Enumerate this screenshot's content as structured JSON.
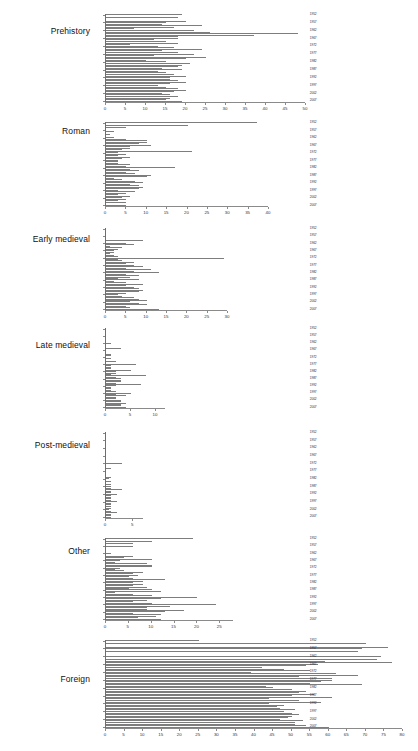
{
  "figure": {
    "type": "multi-panel-horizontal-bar",
    "background": "#ffffff",
    "bar_color": "#7d7d7d",
    "axis_color": "#8a8a8a",
    "panel_count": 7
  },
  "chart_data": [
    {
      "type": "bar",
      "orientation": "horizontal",
      "title": "Prehistory",
      "xlabel": "",
      "ylabel": "",
      "xlim": [
        0,
        50
      ],
      "xticks": [
        0,
        5,
        10,
        15,
        20,
        25,
        30,
        35,
        40,
        45,
        50
      ],
      "xticklabels": [
        "0",
        "5",
        "10",
        "15",
        "20",
        "25",
        "30",
        "35",
        "40",
        "45",
        "50"
      ],
      "grid": false,
      "categories": [
        1952,
        1953,
        1954,
        1955,
        1956,
        1957,
        1958,
        1959,
        1960,
        1961,
        1962,
        1963,
        1964,
        1965,
        1966,
        1967,
        1968,
        1969,
        1970,
        1971,
        1972,
        1973,
        1974,
        1975,
        1976,
        1977,
        1978,
        1979,
        1980,
        1981,
        1982,
        1983,
        1984,
        1985,
        1986,
        1987,
        1988,
        1989,
        1990,
        1991,
        1992,
        1993,
        1994,
        1995,
        1996,
        1997,
        1998,
        1999,
        2000,
        2001,
        2002,
        2003,
        2004,
        2005,
        2006,
        2007
      ],
      "yticklabels": [
        "1952",
        "1957",
        "1962",
        "1967",
        "1972",
        "1977",
        "1982",
        "1987",
        "1992",
        "1997",
        "2002",
        "2007"
      ],
      "values": [
        19,
        0,
        18,
        0,
        20,
        15,
        14,
        24,
        17,
        7,
        22,
        26,
        48,
        37,
        18,
        18,
        12,
        15,
        18,
        6,
        13,
        17,
        24,
        14,
        18,
        22,
        12,
        25,
        20,
        10,
        15,
        21,
        19,
        18,
        14,
        19,
        13,
        15,
        17,
        20,
        16,
        16,
        18,
        20,
        16,
        13,
        15,
        18,
        20,
        17,
        14,
        16,
        18,
        16,
        15,
        19
      ]
    },
    {
      "type": "bar",
      "orientation": "horizontal",
      "title": "Roman",
      "xlabel": "",
      "ylabel": "",
      "xlim": [
        0,
        40
      ],
      "xticks": [
        0,
        5,
        10,
        15,
        20,
        25,
        30,
        35,
        40
      ],
      "xticklabels": [
        "0",
        "5",
        "10",
        "15",
        "20",
        "25",
        "30",
        "35",
        "40"
      ],
      "grid": false,
      "categories": [
        1952,
        1953,
        1954,
        1955,
        1956,
        1957,
        1958,
        1959,
        1960,
        1961,
        1962,
        1963,
        1964,
        1965,
        1966,
        1967,
        1968,
        1969,
        1970,
        1971,
        1972,
        1973,
        1974,
        1975,
        1976,
        1977,
        1978,
        1979,
        1980,
        1981,
        1982,
        1983,
        1984,
        1985,
        1986,
        1987,
        1988,
        1989,
        1990,
        1991,
        1992,
        1993,
        1994,
        1995,
        1996,
        1997,
        1998,
        1999,
        2000,
        2001,
        2002,
        2003,
        2004,
        2005,
        2006,
        2007
      ],
      "yticklabels": [
        "1952",
        "1957",
        "1962",
        "1967",
        "1972",
        "1977",
        "1982",
        "1987",
        "1992",
        "1997",
        "2002",
        "2007"
      ],
      "values": [
        37,
        0,
        20,
        5,
        0,
        0,
        2,
        0,
        1,
        0,
        2,
        5,
        10,
        10,
        8,
        11,
        6,
        6,
        4,
        21,
        3,
        5,
        3,
        6,
        4,
        3,
        3,
        3,
        6,
        5,
        17,
        6,
        8,
        5,
        7,
        11,
        10,
        2,
        4,
        7,
        9,
        6,
        8,
        9,
        8,
        3,
        7,
        5,
        3,
        6,
        4,
        5,
        3,
        5,
        0,
        5
      ]
    },
    {
      "type": "bar",
      "orientation": "horizontal",
      "title": "Early medieval",
      "xlabel": "",
      "ylabel": "",
      "xlim": [
        0,
        30
      ],
      "xticks": [
        0,
        5,
        10,
        15,
        20,
        25,
        30
      ],
      "xticklabels": [
        "0",
        "5",
        "10",
        "15",
        "20",
        "25",
        "30"
      ],
      "grid": false,
      "categories": [
        1952,
        1953,
        1954,
        1955,
        1956,
        1957,
        1958,
        1959,
        1960,
        1961,
        1962,
        1963,
        1964,
        1965,
        1966,
        1967,
        1968,
        1969,
        1970,
        1971,
        1972,
        1973,
        1974,
        1975,
        1976,
        1977,
        1978,
        1979,
        1980,
        1981,
        1982,
        1983,
        1984,
        1985,
        1986,
        1987,
        1988,
        1989,
        1990,
        1991,
        1992,
        1993,
        1994,
        1995,
        1996,
        1997,
        1998,
        1999,
        2000,
        2001,
        2002,
        2003,
        2004,
        2005,
        2006,
        2007
      ],
      "yticklabels": [
        "1952",
        "1957",
        "1962",
        "1967",
        "1972",
        "1977",
        "1982",
        "1987",
        "1992",
        "1997",
        "2002",
        "2007"
      ],
      "values": [
        0,
        0,
        0,
        0,
        0,
        0,
        0,
        0,
        9,
        0,
        5,
        7,
        1,
        4,
        3,
        2,
        2,
        1,
        2,
        3,
        29,
        3,
        4,
        7,
        5,
        7,
        9,
        5,
        11,
        7,
        13,
        5,
        8,
        6,
        3,
        8,
        2,
        5,
        9,
        5,
        7,
        8,
        9,
        8,
        5,
        3,
        4,
        7,
        8,
        10,
        6,
        8,
        10,
        5,
        6,
        13
      ]
    },
    {
      "type": "bar",
      "orientation": "horizontal",
      "title": "Late medieval",
      "xlabel": "",
      "ylabel": "",
      "xlim": [
        0,
        12
      ],
      "xticks": [
        0,
        5,
        10
      ],
      "xticklabels": [
        "0",
        "5",
        "10"
      ],
      "grid": false,
      "categories": [
        1952,
        1953,
        1954,
        1955,
        1956,
        1957,
        1958,
        1959,
        1960,
        1961,
        1962,
        1963,
        1964,
        1965,
        1966,
        1967,
        1968,
        1969,
        1970,
        1971,
        1972,
        1973,
        1974,
        1975,
        1976,
        1977,
        1978,
        1979,
        1980,
        1981,
        1982,
        1983,
        1984,
        1985,
        1986,
        1987,
        1988,
        1989,
        1990,
        1991,
        1992,
        1993,
        1994,
        1995,
        1996,
        1997,
        1998,
        1999,
        2000,
        2001,
        2002,
        2003,
        2004,
        2005,
        2006,
        2007
      ],
      "yticklabels": [
        "1952",
        "1957",
        "1962",
        "1967",
        "1972",
        "1977",
        "1982",
        "1987",
        "1992",
        "1997",
        "2002",
        "2007"
      ],
      "values": [
        0,
        0,
        0,
        0,
        0,
        0,
        0,
        0,
        0,
        0,
        1,
        0,
        0,
        0,
        3,
        0,
        0,
        0,
        1,
        1,
        0,
        1,
        0,
        2,
        0,
        6,
        1,
        1,
        1,
        5,
        2,
        2,
        1,
        8,
        2,
        3,
        3,
        3,
        2,
        7,
        2,
        1,
        1,
        1,
        2,
        5,
        2,
        4,
        2,
        2,
        3,
        3,
        4,
        3,
        3,
        4
      ]
    },
    {
      "type": "bar",
      "orientation": "horizontal",
      "title": "Post-medieval",
      "xlabel": "",
      "ylabel": "",
      "xlim": [
        0,
        7
      ],
      "xticks": [
        0,
        5
      ],
      "xticklabels": [
        "0",
        "5"
      ],
      "grid": false,
      "categories": [
        1952,
        1953,
        1954,
        1955,
        1956,
        1957,
        1958,
        1959,
        1960,
        1961,
        1962,
        1963,
        1964,
        1965,
        1966,
        1967,
        1968,
        1969,
        1970,
        1971,
        1972,
        1973,
        1974,
        1975,
        1976,
        1977,
        1978,
        1979,
        1980,
        1981,
        1982,
        1983,
        1984,
        1985,
        1986,
        1987,
        1988,
        1989,
        1990,
        1991,
        1992,
        1993,
        1994,
        1995,
        1996,
        1997,
        1998,
        1999,
        2000,
        2001,
        2002,
        2003,
        2004,
        2005,
        2006,
        2007
      ],
      "yticklabels": [
        "1952",
        "1957",
        "1962",
        "1967",
        "1972",
        "1977",
        "1982",
        "1987",
        "1992",
        "1997",
        "2002",
        "2007"
      ],
      "values": [
        0,
        0,
        0,
        0,
        0,
        0,
        0,
        0,
        0,
        0,
        0,
        0,
        0,
        0,
        0,
        0,
        0,
        0,
        0,
        0,
        3,
        0,
        0,
        1,
        0,
        0,
        0,
        0,
        0,
        1,
        0.5,
        0,
        1,
        0,
        1,
        1,
        1,
        3,
        1,
        1,
        2,
        1,
        1,
        1,
        1,
        2,
        1,
        1,
        1,
        1,
        0.5,
        1,
        2,
        1,
        1,
        1
      ]
    },
    {
      "type": "bar",
      "orientation": "horizontal",
      "title": "Other",
      "xlabel": "",
      "ylabel": "",
      "xlim": [
        0,
        28
      ],
      "xticks": [
        0,
        5,
        10,
        15,
        20,
        25
      ],
      "xticklabels": [
        "0",
        "5",
        "10",
        "15",
        "20",
        "25"
      ],
      "grid": false,
      "categories": [
        1952,
        1953,
        1954,
        1955,
        1956,
        1957,
        1958,
        1959,
        1960,
        1961,
        1962,
        1963,
        1964,
        1965,
        1966,
        1967,
        1968,
        1969,
        1970,
        1971,
        1972,
        1973,
        1974,
        1975,
        1976,
        1977,
        1978,
        1979,
        1980,
        1981,
        1982,
        1983,
        1984,
        1985,
        1986,
        1987,
        1988,
        1989,
        1990,
        1991,
        1992,
        1993,
        1994,
        1995,
        1996,
        1997,
        1998,
        1999,
        2000,
        2001,
        2002,
        2003,
        2004,
        2005,
        2006,
        2007
      ],
      "yticklabels": [
        "1952",
        "1957",
        "1962",
        "1967",
        "1972",
        "1977",
        "1982",
        "1987",
        "1992",
        "1997",
        "2002",
        "2007"
      ],
      "values": [
        19,
        0,
        10,
        6,
        0,
        6,
        0,
        0,
        0,
        0,
        1,
        0,
        6,
        4,
        10,
        3,
        2,
        9,
        10,
        10,
        3,
        2,
        4,
        8,
        6,
        7,
        5,
        6,
        13,
        8,
        6,
        8,
        6,
        9,
        5,
        10,
        12,
        2,
        6,
        10,
        20,
        12,
        9,
        6,
        10,
        24,
        14,
        9,
        9,
        17,
        13,
        6,
        12,
        11,
        7,
        12
      ]
    },
    {
      "type": "bar",
      "orientation": "horizontal",
      "title": "Foreign",
      "xlabel": "",
      "ylabel": "",
      "xlim": [
        0,
        80
      ],
      "xticks": [
        0,
        5,
        10,
        15,
        20,
        25,
        30,
        35,
        40,
        45,
        50,
        55,
        60,
        65,
        70,
        75,
        80
      ],
      "xticklabels": [
        "0",
        "5",
        "10",
        "15",
        "20",
        "25",
        "30",
        "35",
        "40",
        "45",
        "50",
        "55",
        "60",
        "65",
        "70",
        "75",
        "80"
      ],
      "grid": false,
      "categories": [
        1952,
        1953,
        1954,
        1955,
        1956,
        1957,
        1958,
        1959,
        1960,
        1961,
        1962,
        1963,
        1964,
        1965,
        1966,
        1967,
        1968,
        1969,
        1970,
        1971,
        1972,
        1973,
        1974,
        1975,
        1976,
        1977,
        1978,
        1979,
        1980,
        1981,
        1982,
        1983,
        1984,
        1985,
        1986,
        1987,
        1988,
        1989,
        1990,
        1991,
        1992,
        1993,
        1994,
        1995,
        1996,
        1997,
        1998,
        1999,
        2000,
        2001,
        2002,
        2003,
        2004,
        2005,
        2006,
        2007
      ],
      "yticklabels": [
        "1952",
        "1957",
        "1962",
        "1967",
        "1972",
        "1977",
        "1982",
        "1987",
        "1992",
        "1997",
        "2002",
        "2007"
      ],
      "values": [
        25,
        0,
        70,
        0,
        76,
        69,
        0,
        68,
        0,
        0,
        74,
        0,
        73,
        59,
        77,
        57,
        54,
        42,
        48,
        55,
        39,
        62,
        68,
        52,
        61,
        61,
        58,
        55,
        69,
        43,
        45,
        50,
        54,
        52,
        56,
        50,
        61,
        44,
        52,
        58,
        44,
        48,
        46,
        47,
        51,
        48,
        50,
        52,
        50,
        49,
        47,
        53,
        51,
        51,
        54,
        60
      ]
    }
  ]
}
